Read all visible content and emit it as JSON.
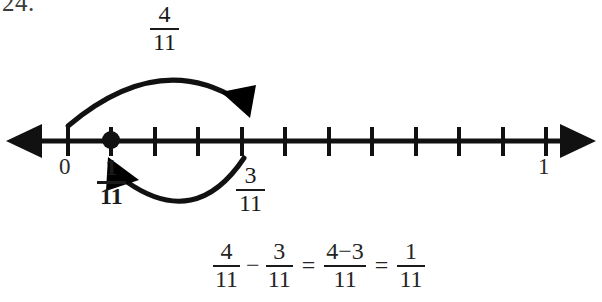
{
  "problem": {
    "number": "24."
  },
  "number_line": {
    "start_label": "0",
    "end_label": "1",
    "tick_count": 12,
    "denominator": 11,
    "point_marker_position": "1/11",
    "color": "#111111"
  },
  "arcs": {
    "upper": {
      "label_numerator": "4",
      "label_denominator": "11",
      "from": "0",
      "to": "4/11",
      "direction": "right"
    },
    "lower": {
      "label_numerator": "3",
      "label_denominator": "11",
      "from": "4/11",
      "to": "1/11",
      "direction": "left"
    }
  },
  "labels": {
    "zero": "0",
    "one": "1",
    "result_numerator": "1",
    "result_denominator": "11",
    "subtrahend_numerator": "3",
    "subtrahend_denominator": "11"
  },
  "equation": {
    "term1": {
      "num": "4",
      "den": "11"
    },
    "operator": "−",
    "term2": {
      "num": "3",
      "den": "11"
    },
    "equals1": "=",
    "term3": {
      "num": "4−3",
      "den": "11"
    },
    "equals2": "=",
    "term4": {
      "num": "1",
      "den": "11"
    }
  }
}
